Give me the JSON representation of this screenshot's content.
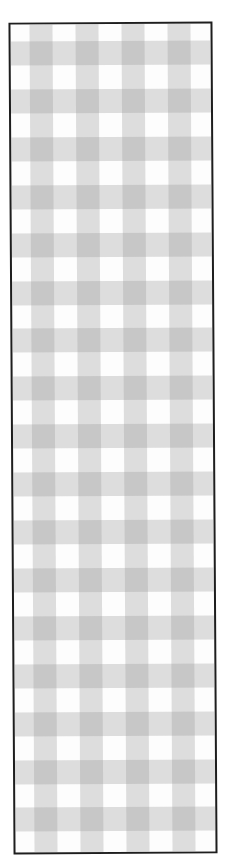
{
  "pattern": {
    "type": "gingham-check",
    "colors": {
      "background": "#fdfdfd",
      "single_stripe": "#dedede",
      "intersection": "#bfbfbf",
      "border": "#1e1e1e"
    },
    "vertical_stripes": {
      "count": 4,
      "offset": 19,
      "width": 23,
      "period": 46
    },
    "horizontal_stripes": {
      "count": 17,
      "offset": 17,
      "height": 24,
      "period": 47.9
    }
  }
}
